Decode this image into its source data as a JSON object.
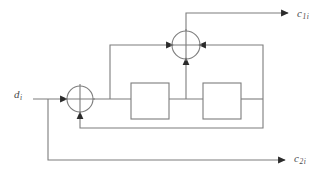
{
  "diagram": {
    "type": "signal-flow-block-diagram",
    "colors": {
      "line": "#7d7d7d",
      "arrow": "#2b2b2b",
      "text": "#4a4a4a",
      "background": "#ffffff"
    },
    "input": {
      "label_base": "d",
      "label_sub": "i"
    },
    "outputs": [
      {
        "id": "c1",
        "label_base": "c",
        "label_sub_num": "1",
        "label_sub_idx": "i"
      },
      {
        "id": "c2",
        "label_base": "c",
        "label_sub_num": "2",
        "label_sub_idx": "i"
      }
    ],
    "adders": [
      {
        "id": "input-adder",
        "symbol": "crosshair-circle",
        "cx": 80,
        "cy": 99,
        "r": 13
      },
      {
        "id": "output-adder",
        "symbol": "crosshair-circle",
        "cx": 186,
        "cy": 45,
        "r": 14
      }
    ],
    "delay_blocks": [
      {
        "id": "delay-1",
        "label": "",
        "x": 131,
        "y": 83,
        "w": 38,
        "h": 36
      },
      {
        "id": "delay-2",
        "label": "",
        "x": 203,
        "y": 83,
        "w": 38,
        "h": 36
      }
    ]
  }
}
